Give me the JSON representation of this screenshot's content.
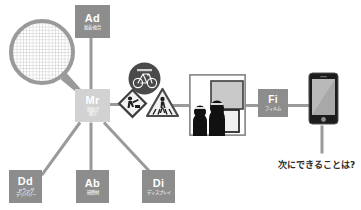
{
  "diagram": {
    "background_color": "#ffffff",
    "line_color": "#9a9a9a",
    "node_color": "#8d8d8d",
    "highlight_node_color": "#d2d2d2"
  },
  "nodes": {
    "mr": {
      "code": "Mr",
      "sub_line1": "微粒子",
      "sub_line2": "粒子"
    },
    "ad": {
      "code": "Ad",
      "sub_line1": "接着・接合",
      "sub_line2": ""
    },
    "dd": {
      "code": "Dd",
      "sub_line1": "ドラッグ",
      "sub_line2": "デリバリー"
    },
    "ab": {
      "code": "Ab",
      "sub_line1": "研磨材",
      "sub_line2": ""
    },
    "di": {
      "code": "Di",
      "sub_line1": "ディスプレイ",
      "sub_line2": ""
    },
    "fi": {
      "code": "Fi",
      "sub_line1": "フィルム",
      "sub_line2": ""
    }
  },
  "icons": {
    "magnifier": "magnifier-icon",
    "sign_bicycle": "bicycle-sign-icon",
    "sign_worker": "roadwork-worker-sign-icon",
    "sign_crossing": "pedestrian-crossing-sign-icon",
    "photo": "display-viewing-photo",
    "phone": "smartphone-icon"
  },
  "caption": {
    "text": "次にできることは?"
  }
}
